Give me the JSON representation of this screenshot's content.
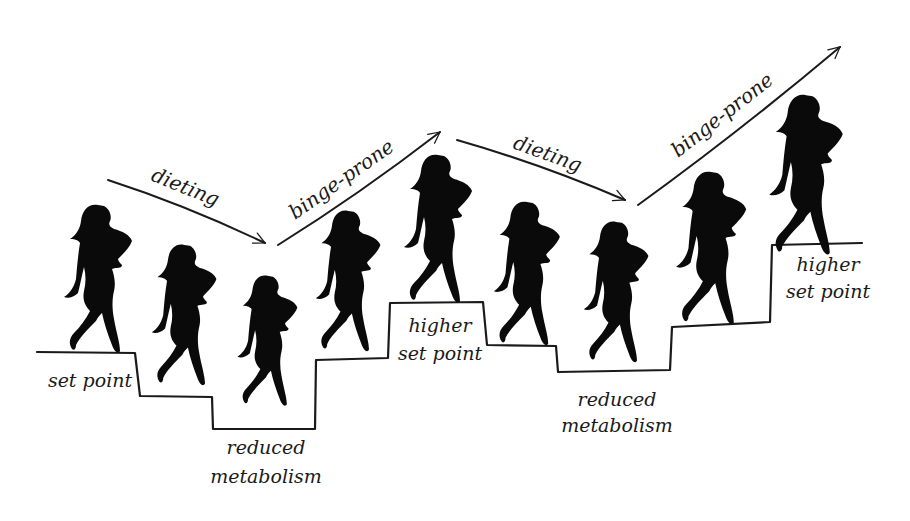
{
  "diagram": {
    "title": "",
    "colors": {
      "ink": "#1a1a1a",
      "silhouette": "#0a0a0a",
      "background": "#ffffff"
    },
    "arrows": [
      {
        "label": "dieting",
        "direction": "down",
        "from": [
          108,
          180
        ],
        "to": [
          265,
          243
        ],
        "label_pos": [
          150,
          180
        ],
        "label_angle": 22
      },
      {
        "label": "binge-prone",
        "direction": "up",
        "from": [
          278,
          245
        ],
        "to": [
          440,
          132
        ],
        "label_pos": [
          295,
          220
        ],
        "label_angle": -35
      },
      {
        "label": "dieting",
        "direction": "down",
        "from": [
          457,
          140
        ],
        "to": [
          625,
          200
        ],
        "label_pos": [
          512,
          148
        ],
        "label_angle": 20
      },
      {
        "label": "binge-prone",
        "direction": "up",
        "from": [
          638,
          205
        ],
        "to": [
          840,
          47
        ],
        "label_pos": [
          678,
          158
        ],
        "label_angle": -38
      }
    ],
    "step_labels": [
      {
        "lines": [
          "set point"
        ],
        "x": 90,
        "y": [
          387
        ]
      },
      {
        "lines": [
          "reduced",
          "metabolism"
        ],
        "x": 266,
        "y": [
          454,
          483
        ]
      },
      {
        "lines": [
          "higher",
          "set point"
        ],
        "x": 440,
        "y": [
          332,
          360
        ]
      },
      {
        "lines": [
          "reduced",
          "metabolism"
        ],
        "x": 617,
        "y": [
          406,
          432
        ]
      },
      {
        "lines": [
          "higher",
          "set point"
        ],
        "x": 828,
        "y": [
          271,
          298
        ]
      }
    ],
    "figures": [
      {
        "id": 1,
        "x": 60,
        "y": 203,
        "scale": 1.0,
        "stage": "set point"
      },
      {
        "id": 2,
        "x": 148,
        "y": 243,
        "scale": 0.95,
        "stage": "dieting"
      },
      {
        "id": 3,
        "x": 234,
        "y": 274,
        "scale": 0.88,
        "stage": "reduced metabolism"
      },
      {
        "id": 4,
        "x": 312,
        "y": 209,
        "scale": 0.95,
        "stage": "binge-prone"
      },
      {
        "id": 5,
        "x": 400,
        "y": 153,
        "scale": 1.0,
        "stage": "higher set point"
      },
      {
        "id": 6,
        "x": 490,
        "y": 200,
        "scale": 0.97,
        "stage": "dieting"
      },
      {
        "id": 7,
        "x": 580,
        "y": 220,
        "scale": 0.95,
        "stage": "reduced metabolism"
      },
      {
        "id": 8,
        "x": 672,
        "y": 170,
        "scale": 1.03,
        "stage": "binge-prone"
      },
      {
        "id": 9,
        "x": 765,
        "y": 93,
        "scale": 1.08,
        "stage": "higher set point"
      }
    ],
    "step_path": "M37,352 L135,353 L140,396 L212,397 L213,429 L315,429 L316,360 L388,358 L390,303 L483,302 L487,345 L556,346 L558,372 L670,370 L672,327 L770,322 L772,245 L862,243"
  }
}
